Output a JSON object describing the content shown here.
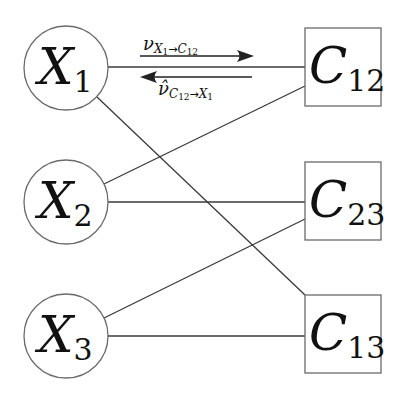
{
  "diagram": {
    "type": "factor-graph",
    "colors": {
      "edge": "#3a3a3a",
      "node_stroke": "#6a6a6a",
      "text": "#111111",
      "background": "#ffffff"
    },
    "variable_nodes": [
      {
        "id": "X1",
        "letter": "X",
        "subscript": "1",
        "cx": 66,
        "cy": 68,
        "r": 42
      },
      {
        "id": "X2",
        "letter": "X",
        "subscript": "2",
        "cx": 66,
        "cy": 202,
        "r": 42
      },
      {
        "id": "X3",
        "letter": "X",
        "subscript": "3",
        "cx": 66,
        "cy": 336,
        "r": 42
      }
    ],
    "factor_nodes": [
      {
        "id": "C12",
        "letter": "C",
        "subscript": "12",
        "x": 305,
        "y": 28,
        "w": 76,
        "h": 78
      },
      {
        "id": "C23",
        "letter": "C",
        "subscript": "23",
        "x": 305,
        "y": 162,
        "w": 76,
        "h": 78
      },
      {
        "id": "C13",
        "letter": "C",
        "subscript": "13",
        "x": 305,
        "y": 295,
        "w": 76,
        "h": 78
      }
    ],
    "edges": [
      {
        "from": "X1",
        "to": "C12"
      },
      {
        "from": "X1",
        "to": "C13"
      },
      {
        "from": "X2",
        "to": "C12"
      },
      {
        "from": "X2",
        "to": "C23"
      },
      {
        "from": "X3",
        "to": "C23"
      },
      {
        "from": "X3",
        "to": "C13"
      }
    ],
    "messages": [
      {
        "id": "msg-x1-to-c12",
        "symbol": "ν",
        "hat": false,
        "subscript_from": "X",
        "subscript_from_index": "1",
        "arrow": "→",
        "subscript_to": "C",
        "subscript_to_index": "12",
        "direction": "right",
        "text": "ν_{X1→C12}"
      },
      {
        "id": "msg-c12-to-x1",
        "symbol": "ν̂",
        "hat": true,
        "subscript_from": "C",
        "subscript_from_index": "12",
        "arrow": "→",
        "subscript_to": "X",
        "subscript_to_index": "1",
        "direction": "left",
        "text": "ν̂_{C12→X1}"
      }
    ]
  }
}
